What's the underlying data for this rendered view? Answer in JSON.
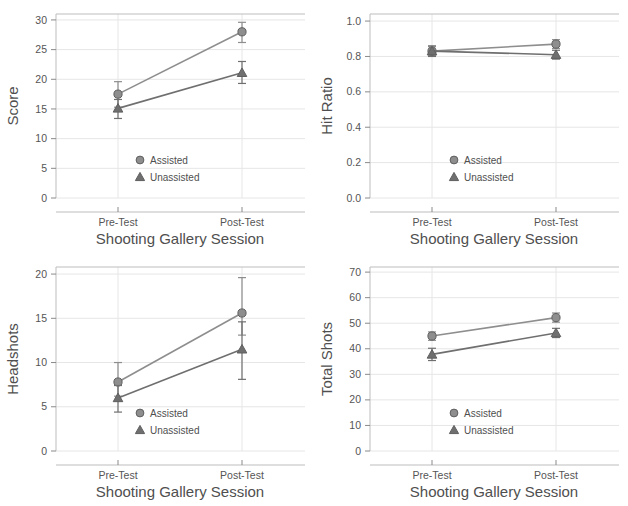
{
  "figure": {
    "layout": "2x2 grid of line plots",
    "panel_count": 4,
    "palette": {
      "assisted": "#8e8e8e",
      "unassisted": "#6f6f6f",
      "axis": "#bdbdbd",
      "grid": "#e6e6e6",
      "text": "#4f4f4f",
      "background": "#ffffff"
    }
  },
  "legend": {
    "assisted_label": "Assisted",
    "unassisted_label": "Unassisted",
    "assisted_marker": "circle",
    "unassisted_marker": "triangle",
    "position": "inside lower-center-right"
  },
  "chart_data": [
    {
      "type": "line",
      "id": "score",
      "title": "",
      "xlabel": "Shooting Gallery Session",
      "ylabel": "Score",
      "categories": [
        "Pre-Test",
        "Post-Test"
      ],
      "ylim": [
        0,
        31
      ],
      "yticks": [
        0,
        5,
        10,
        15,
        20,
        25,
        30
      ],
      "ytick_labels": [
        "0",
        "5",
        "10",
        "15",
        "20",
        "25",
        "30"
      ],
      "grid": true,
      "legend_position": "lower-center",
      "series": [
        {
          "name": "Assisted",
          "marker": "circle",
          "values": [
            17.5,
            28.0
          ],
          "err_low": [
            15.3,
            26.2
          ],
          "err_high": [
            19.6,
            29.6
          ]
        },
        {
          "name": "Unassisted",
          "marker": "triangle",
          "values": [
            15.1,
            21.1
          ],
          "err_low": [
            13.4,
            19.3
          ],
          "err_high": [
            16.6,
            23.0
          ]
        }
      ]
    },
    {
      "type": "line",
      "id": "hit_ratio",
      "title": "",
      "xlabel": "Shooting Gallery Session",
      "ylabel": "Hit Ratio",
      "categories": [
        "Pre-Test",
        "Post-Test"
      ],
      "ylim": [
        0.0,
        1.04
      ],
      "yticks": [
        0.0,
        0.2,
        0.4,
        0.6,
        0.8,
        1.0
      ],
      "ytick_labels": [
        "0.0",
        "0.2",
        "0.4",
        "0.6",
        "0.8",
        "1.0"
      ],
      "grid": true,
      "legend_position": "lower-center",
      "series": [
        {
          "name": "Assisted",
          "marker": "circle",
          "values": [
            0.83,
            0.87
          ],
          "err_low": [
            0.805,
            0.845
          ],
          "err_high": [
            0.855,
            0.895
          ]
        },
        {
          "name": "Unassisted",
          "marker": "triangle",
          "values": [
            0.83,
            0.81
          ],
          "err_low": [
            0.8,
            0.785
          ],
          "err_high": [
            0.86,
            0.835
          ]
        }
      ]
    },
    {
      "type": "line",
      "id": "headshots",
      "title": "",
      "xlabel": "Shooting Gallery Session",
      "ylabel": "Headshots",
      "categories": [
        "Pre-Test",
        "Post-Test"
      ],
      "ylim": [
        0,
        20.8
      ],
      "yticks": [
        0,
        5,
        10,
        15,
        20
      ],
      "ytick_labels": [
        "0",
        "5",
        "10",
        "15",
        "20"
      ],
      "grid": true,
      "legend_position": "lower-center",
      "series": [
        {
          "name": "Assisted",
          "marker": "circle",
          "values": [
            7.8,
            15.6
          ],
          "err_low": [
            6.2,
            13.1
          ],
          "err_high": [
            10.0,
            19.6
          ]
        },
        {
          "name": "Unassisted",
          "marker": "triangle",
          "values": [
            6.0,
            11.5
          ],
          "err_low": [
            4.4,
            8.1
          ],
          "err_high": [
            7.4,
            14.6
          ]
        }
      ]
    },
    {
      "type": "line",
      "id": "total_shots",
      "title": "",
      "xlabel": "Shooting Gallery Session",
      "ylabel": "Total Shots",
      "categories": [
        "Pre-Test",
        "Post-Test"
      ],
      "ylim": [
        0,
        72
      ],
      "yticks": [
        0,
        10,
        20,
        30,
        40,
        50,
        60,
        70
      ],
      "ytick_labels": [
        "0",
        "10",
        "20",
        "30",
        "40",
        "50",
        "60",
        "70"
      ],
      "grid": true,
      "legend_position": "lower-center",
      "series": [
        {
          "name": "Assisted",
          "marker": "circle",
          "values": [
            45.0,
            52.2
          ],
          "err_low": [
            43.3,
            50.4
          ],
          "err_high": [
            46.6,
            54.0
          ]
        },
        {
          "name": "Unassisted",
          "marker": "triangle",
          "values": [
            37.8,
            46.2
          ],
          "err_low": [
            35.4,
            44.4
          ],
          "err_high": [
            40.2,
            48.0
          ]
        }
      ]
    }
  ]
}
